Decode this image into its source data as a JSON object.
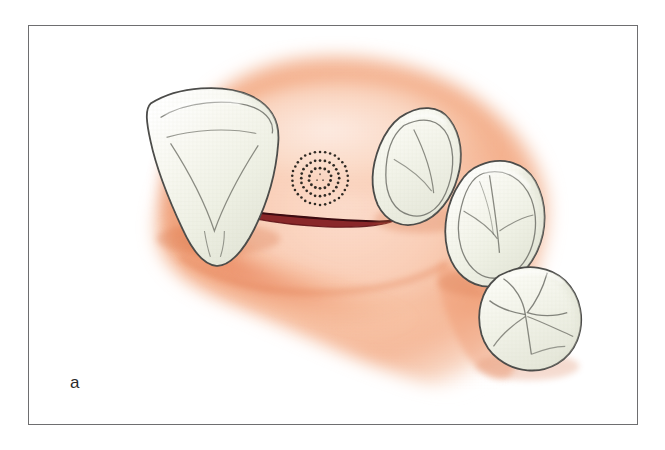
{
  "figure": {
    "panel_label": "a",
    "caption_text": "",
    "frame": {
      "border_color": "#6e6e70",
      "background": "#ffffff"
    }
  },
  "palette": {
    "gingiva_light": "#fde4d7",
    "gingiva_mid": "#f6b894",
    "gingiva_deep": "#ef9a72",
    "gingiva_shadow": "#e8835c",
    "tooth_fill": "#f7f7ef",
    "tooth_shade": "#e6e7dc",
    "tooth_outline": "#4a4a48",
    "tooth_detail": "#6f7068",
    "incision_line": "#5a0f14",
    "incision_glow": "#8c1f22",
    "marker_dots": "#2f2a24",
    "label_color": "#2b2b2b"
  },
  "anatomy": {
    "title": "Edentulous ridge with crestal incision and implant site marking",
    "region": "posterior mandibular alveolar ridge",
    "teeth": [
      {
        "id": "tooth-canine",
        "name": "canine",
        "position": "anterior-left",
        "shape": "triangular-conical",
        "center_x": 213,
        "center_y": 155
      },
      {
        "id": "tooth-second-premolar",
        "name": "second premolar",
        "position": "posterior-upper",
        "shape": "triangular-cusped",
        "center_x": 415,
        "center_y": 180
      },
      {
        "id": "tooth-first-molar",
        "name": "first molar",
        "position": "posterior-middle",
        "shape": "rhomboid-cusped",
        "center_x": 492,
        "center_y": 235
      },
      {
        "id": "tooth-second-molar",
        "name": "second molar",
        "position": "posterior-lower",
        "shape": "rounded-quadricuspid",
        "center_x": 520,
        "center_y": 310
      }
    ],
    "incision": {
      "id": "crestal-incision",
      "name": "crestal incision",
      "start_x": 207,
      "start_y": 207,
      "end_x": 392,
      "end_y": 222,
      "color": "#5a0f14"
    },
    "implant_site_marker": {
      "id": "implant-site-marker",
      "name": "implant site marker",
      "style": "concentric dotted rings",
      "center_x": 320,
      "center_y": 178,
      "ring_radii": [
        11,
        19,
        28
      ],
      "ring_dot_counts": [
        14,
        24,
        34
      ],
      "dot_color": "#2f2a24"
    },
    "edentulous_span": {
      "name": "edentulous ridge span",
      "from_tooth": "canine",
      "to_tooth": "second premolar"
    }
  }
}
